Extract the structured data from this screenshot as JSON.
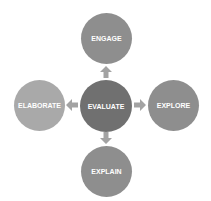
{
  "diagram": {
    "center": {
      "label": "EVALUATE",
      "color": "#707070"
    },
    "nodes": {
      "top": {
        "label": "ENGAGE",
        "color": "#8e8e8e"
      },
      "left": {
        "label": "ELABORATE",
        "color": "#a9a9a9"
      },
      "right": {
        "label": "EXPLORE",
        "color": "#8e8e8e"
      },
      "bottom": {
        "label": "EXPLAIN",
        "color": "#8e8e8e"
      }
    },
    "arrow_color": "#a3a3a3",
    "arrows": [
      "up",
      "left",
      "right",
      "down"
    ]
  }
}
